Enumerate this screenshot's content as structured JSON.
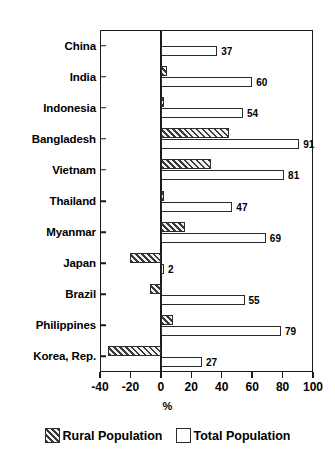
{
  "chart_data": {
    "type": "bar",
    "orientation": "horizontal",
    "title": "",
    "subtitle": "",
    "xlabel": "%",
    "ylabel": "",
    "xlim": [
      -40,
      100
    ],
    "xticks": [
      -40,
      -20,
      0,
      20,
      40,
      60,
      80,
      100
    ],
    "xticklabels": [
      "-40",
      "-20",
      "0",
      "20",
      "40",
      "60",
      "80",
      "100"
    ],
    "grid": false,
    "legend_position": "bottom",
    "categories": [
      "China",
      "India",
      "Indonesia",
      "Bangladesh",
      "Vietnam",
      "Thailand",
      "Myanmar",
      "Japan",
      "Brazil",
      "Philippines",
      "Korea, Rep."
    ],
    "series": [
      {
        "name": "Rural Population",
        "style": "hatched",
        "values": [
          0,
          4,
          2,
          45,
          33,
          2,
          16,
          -20,
          -7,
          8,
          -35
        ],
        "labels": [
          "",
          "",
          "",
          "",
          "",
          "",
          "",
          "",
          "",
          "",
          ""
        ]
      },
      {
        "name": "Total Population",
        "style": "open",
        "values": [
          37,
          60,
          54,
          91,
          81,
          47,
          69,
          2,
          55,
          79,
          27
        ],
        "labels": [
          "37",
          "60",
          "54",
          "91",
          "81",
          "47",
          "69",
          "2",
          "55",
          "79",
          "27"
        ]
      }
    ]
  },
  "legend": {
    "items": [
      {
        "label": "Rural Population",
        "style": "rural"
      },
      {
        "label": "Total Population",
        "style": "total"
      }
    ]
  },
  "axis": {
    "x_title": "%"
  }
}
